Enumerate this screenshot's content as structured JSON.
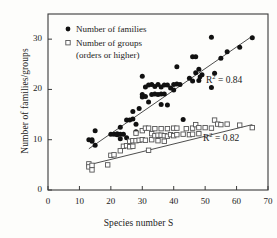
{
  "chart_data": {
    "type": "scatter",
    "title": "",
    "xlabel": "Species number S",
    "ylabel": "Number of families/groups",
    "xlim": [
      0,
      70
    ],
    "ylim": [
      0,
      35
    ],
    "xticks": [
      0,
      10,
      20,
      30,
      40,
      50,
      60,
      70
    ],
    "yticks": [
      0,
      10,
      20,
      30
    ],
    "grid": false,
    "legend_position": "top-left",
    "series": [
      {
        "name": "Number of families",
        "marker": "filled-circle",
        "color": "#111111",
        "r_squared": "0.84",
        "r_squared_label": "R² = 0.84",
        "trendline": {
          "x": [
            13,
            65
          ],
          "y": [
            8.2,
            30.6
          ]
        },
        "points": [
          [
            13,
            10.0
          ],
          [
            14,
            10.0
          ],
          [
            14,
            9.7
          ],
          [
            15,
            11.8
          ],
          [
            15,
            8.9
          ],
          [
            20,
            11.1
          ],
          [
            21,
            11.1
          ],
          [
            22,
            11.2
          ],
          [
            22,
            11.0
          ],
          [
            23,
            11.1
          ],
          [
            23,
            12.5
          ],
          [
            23,
            10.2
          ],
          [
            24,
            11.1
          ],
          [
            25,
            10.4
          ],
          [
            25,
            13.9
          ],
          [
            26,
            13.9
          ],
          [
            27,
            14.1
          ],
          [
            27,
            15.6
          ],
          [
            28,
            11.6
          ],
          [
            28,
            13.1
          ],
          [
            29,
            16.2
          ],
          [
            30,
            18.5
          ],
          [
            30,
            22.6
          ],
          [
            30,
            19.0
          ],
          [
            31,
            18.6
          ],
          [
            31,
            20.5
          ],
          [
            32,
            17.5
          ],
          [
            32,
            20.9
          ],
          [
            33,
            19.0
          ],
          [
            33,
            21.0
          ],
          [
            34,
            19.1
          ],
          [
            34,
            20.6
          ],
          [
            35,
            19.0
          ],
          [
            35,
            21.0
          ],
          [
            36,
            19.1
          ],
          [
            36,
            20.5
          ],
          [
            36,
            17.0
          ],
          [
            37,
            20.9
          ],
          [
            37,
            19.1
          ],
          [
            38,
            20.9
          ],
          [
            38,
            16.9
          ],
          [
            39,
            20.3
          ],
          [
            40,
            21.0
          ],
          [
            40,
            19.9
          ],
          [
            41,
            21.1
          ],
          [
            41,
            24.5
          ],
          [
            42,
            21.0
          ],
          [
            43,
            14.0
          ],
          [
            45,
            22.2
          ],
          [
            46,
            26.5
          ],
          [
            46,
            21.7
          ],
          [
            47,
            26.5
          ],
          [
            47,
            23.3
          ],
          [
            48,
            24.0
          ],
          [
            48,
            21.8
          ],
          [
            49,
            22.9
          ],
          [
            52,
            30.4
          ],
          [
            52,
            20.4
          ],
          [
            53,
            23.2
          ],
          [
            55,
            26.2
          ],
          [
            57,
            27.5
          ],
          [
            61,
            28.4
          ],
          [
            65,
            30.3
          ]
        ]
      },
      {
        "name": "Number of groups (orders or higher)",
        "marker": "open-square",
        "color": "#555555",
        "r_squared": "0.82",
        "r_squared_label": "R² = 0.82",
        "trendline": {
          "x": [
            13,
            65
          ],
          "y": [
            5.0,
            13.0
          ]
        },
        "points": [
          [
            13,
            5.2
          ],
          [
            13,
            4.6
          ],
          [
            14,
            4.9
          ],
          [
            14,
            4.0
          ],
          [
            19,
            5.0
          ],
          [
            20,
            6.9
          ],
          [
            21,
            7.0
          ],
          [
            23,
            7.8
          ],
          [
            24,
            8.7
          ],
          [
            25,
            8.8
          ],
          [
            26,
            8.6
          ],
          [
            26,
            9.7
          ],
          [
            27,
            8.7
          ],
          [
            27,
            9.8
          ],
          [
            28,
            9.8
          ],
          [
            28,
            11.3
          ],
          [
            29,
            9.9
          ],
          [
            30,
            10.0
          ],
          [
            30,
            11.8
          ],
          [
            31,
            12.3
          ],
          [
            31,
            9.9
          ],
          [
            32,
            12.3
          ],
          [
            32,
            7.9
          ],
          [
            33,
            10.0
          ],
          [
            33,
            11.2
          ],
          [
            34,
            10.8
          ],
          [
            34,
            12.2
          ],
          [
            35,
            10.9
          ],
          [
            35,
            9.8
          ],
          [
            36,
            10.9
          ],
          [
            36,
            12.2
          ],
          [
            37,
            10.8
          ],
          [
            37,
            9.7
          ],
          [
            38,
            12.2
          ],
          [
            38,
            10.7
          ],
          [
            39,
            11.0
          ],
          [
            40,
            12.3
          ],
          [
            40,
            10.8
          ],
          [
            41,
            12.3
          ],
          [
            41,
            11.0
          ],
          [
            43,
            11.1
          ],
          [
            44,
            12.2
          ],
          [
            45,
            11.0
          ],
          [
            46,
            12.3
          ],
          [
            46,
            11.1
          ],
          [
            47,
            13.0
          ],
          [
            48,
            12.4
          ],
          [
            48,
            11.2
          ],
          [
            50,
            12.4
          ],
          [
            52,
            12.3
          ],
          [
            53,
            13.9
          ],
          [
            54,
            13.1
          ],
          [
            55,
            13.0
          ],
          [
            57,
            13.1
          ],
          [
            61,
            12.9
          ],
          [
            65,
            12.4
          ]
        ]
      }
    ]
  },
  "legend": {
    "items": [
      {
        "label": "Number of families",
        "marker": "filled-circle"
      },
      {
        "label": "Number of groups",
        "marker": "open-square"
      },
      {
        "label": "(orders or higher)",
        "marker": "none"
      }
    ]
  },
  "axes": {
    "x_title": "Species number S",
    "y_title": "Number of families/groups",
    "x_tick_labels": [
      "0",
      "10",
      "20",
      "30",
      "40",
      "50",
      "60",
      "70"
    ],
    "y_tick_labels": [
      "0",
      "10",
      "20",
      "30"
    ]
  },
  "annotations": {
    "r2_families_prefix": "R",
    "r2_families_sup": "2",
    "r2_families_value": " = 0.84",
    "r2_groups_prefix": "R",
    "r2_groups_sup": "2",
    "r2_groups_value": " = 0.82"
  },
  "colors": {
    "families_marker": "#111111",
    "groups_marker": "#555555",
    "frame": "#3a3a3a",
    "background": "#fdfdfb"
  }
}
